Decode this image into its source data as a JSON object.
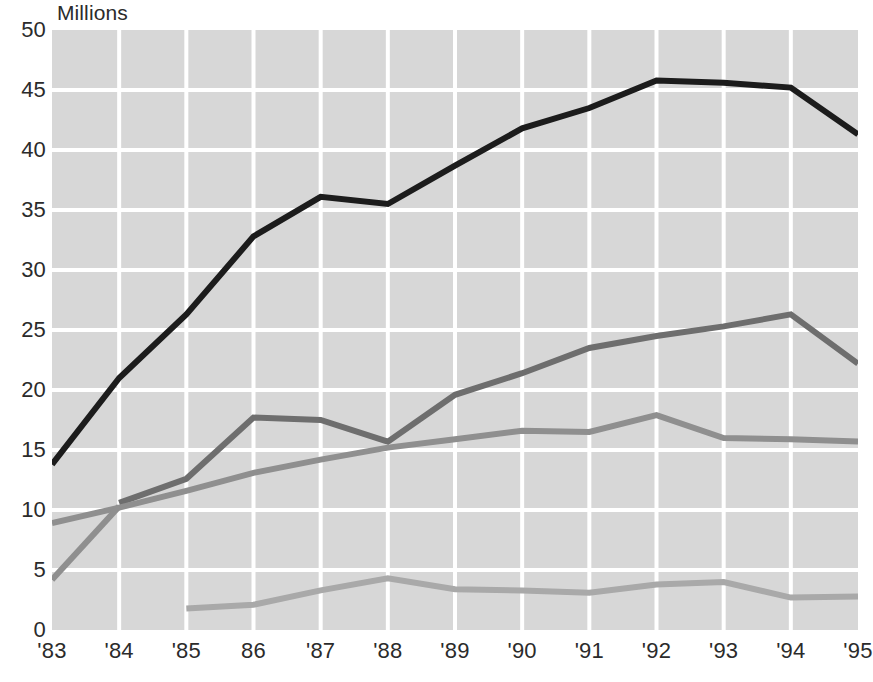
{
  "chart_data": {
    "type": "line",
    "title": "",
    "ylabel": "Millions",
    "xlabel": "",
    "ylim": [
      0,
      50
    ],
    "ytick_values": [
      0,
      5,
      10,
      15,
      20,
      25,
      30,
      35,
      40,
      45,
      50
    ],
    "ytick_labels": [
      "0",
      "5",
      "10",
      "15",
      "20",
      "25",
      "30",
      "35",
      "40",
      "45",
      "50"
    ],
    "categories": [
      "'83",
      "'84",
      "'85",
      "86",
      "'87",
      "'88",
      "'89",
      "'90",
      "'91",
      "'92",
      "'93",
      "'94",
      "'95"
    ],
    "grid": true,
    "grid_color": "#ffffff",
    "plot_background": "#d7d7d7",
    "legend": "none",
    "legend_position": "none",
    "series": [
      {
        "name": "series-1-black",
        "color": "#1c1c1c",
        "line_width": 6,
        "x": [
          "'83",
          "'84",
          "'85",
          "86",
          "'87",
          "'88",
          "'89",
          "'90",
          "'91",
          "'92",
          "'93",
          "'94",
          "'95"
        ],
        "values": [
          13.8,
          21.0,
          26.3,
          32.8,
          36.1,
          35.5,
          38.7,
          41.8,
          43.5,
          45.8,
          45.6,
          45.2,
          41.3
        ]
      },
      {
        "name": "series-2-dark-gray",
        "color": "#6e6e6e",
        "line_width": 6,
        "x": [
          "'84",
          "'85",
          "86",
          "'87",
          "'88",
          "'89",
          "'90",
          "'91",
          "'92",
          "'93",
          "'94",
          "'95"
        ],
        "values": [
          10.6,
          12.6,
          17.7,
          17.5,
          15.7,
          19.6,
          21.4,
          23.5,
          24.5,
          25.3,
          26.3,
          22.2
        ]
      },
      {
        "name": "series-3-medium-gray",
        "color": "#8f8f8f",
        "line_width": 6,
        "x": [
          "'83",
          "'84",
          "'85",
          "86",
          "'87",
          "'88",
          "'89",
          "'90",
          "'91",
          "'92",
          "'93",
          "'94",
          "'95"
        ],
        "values": [
          8.9,
          10.2,
          11.6,
          13.1,
          14.2,
          15.2,
          15.9,
          16.6,
          16.5,
          17.9,
          16.0,
          15.9,
          15.7
        ]
      },
      {
        "name": "series-4-steep-gray",
        "color": "#8f8f8f",
        "line_width": 6,
        "x": [
          "'83",
          "'84"
        ],
        "values": [
          4.2,
          10.3
        ]
      },
      {
        "name": "series-5-light-gray",
        "color": "#a9a9a9",
        "line_width": 6,
        "x": [
          "'85",
          "86",
          "'87",
          "'88",
          "'89",
          "'90",
          "'91",
          "'92",
          "'93",
          "'94",
          "'95"
        ],
        "values": [
          1.8,
          2.1,
          3.3,
          4.3,
          3.4,
          3.3,
          3.1,
          3.8,
          4.0,
          2.7,
          2.8
        ]
      }
    ]
  }
}
